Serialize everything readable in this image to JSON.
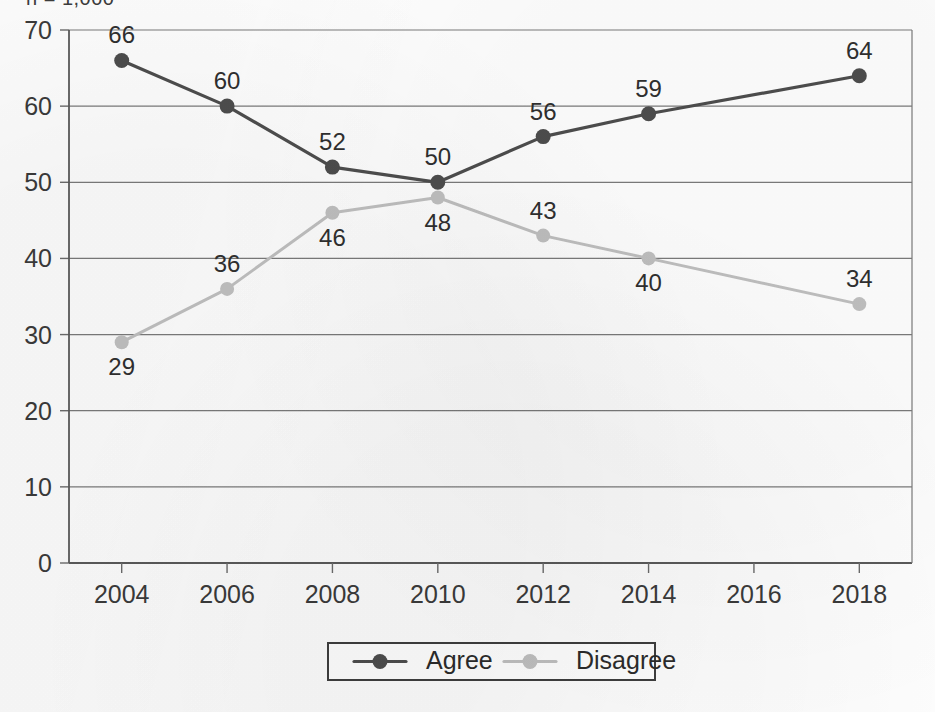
{
  "annotation": {
    "sample_note": "n = 1,000"
  },
  "chart_data": {
    "type": "line",
    "title": "",
    "subtitle": "",
    "xlabel": "",
    "ylabel": "",
    "categories": [
      "2004",
      "2006",
      "2008",
      "2010",
      "2012",
      "2014",
      "2016",
      "2018"
    ],
    "x": [
      2004,
      2006,
      2008,
      2010,
      2012,
      2014,
      2016,
      2018
    ],
    "series": [
      {
        "name": "Agree",
        "color": "#4d4d4d",
        "marker": "circle",
        "x": [
          2004,
          2006,
          2008,
          2010,
          2012,
          2014,
          2018
        ],
        "values": [
          66,
          60,
          52,
          50,
          56,
          59,
          64
        ],
        "labels": [
          "66",
          "60",
          "52",
          "50",
          "56",
          "59",
          "64"
        ],
        "label_positions": [
          "above",
          "above",
          "above",
          "above",
          "above",
          "above",
          "above"
        ]
      },
      {
        "name": "Disagree",
        "color": "#bfbfbf",
        "marker": "circle",
        "x": [
          2004,
          2006,
          2008,
          2010,
          2012,
          2014,
          2018
        ],
        "values": [
          29,
          36,
          46,
          48,
          43,
          40,
          34
        ],
        "labels": [
          "29",
          "36",
          "46",
          "48",
          "43",
          "40",
          "34"
        ],
        "label_positions": [
          "below",
          "above",
          "below",
          "below",
          "above",
          "below",
          "above"
        ]
      }
    ],
    "ylim": [
      0,
      70
    ],
    "yticks": [
      0,
      10,
      20,
      30,
      40,
      50,
      60,
      70
    ],
    "ytick_labels": [
      "0",
      "10",
      "20",
      "30",
      "40",
      "50",
      "60",
      "70"
    ],
    "xlim": [
      2003,
      2019
    ],
    "grid": true,
    "grid_axis": "y",
    "legend_position": "bottom",
    "legend_entries": [
      "Agree",
      "Disagree"
    ]
  }
}
